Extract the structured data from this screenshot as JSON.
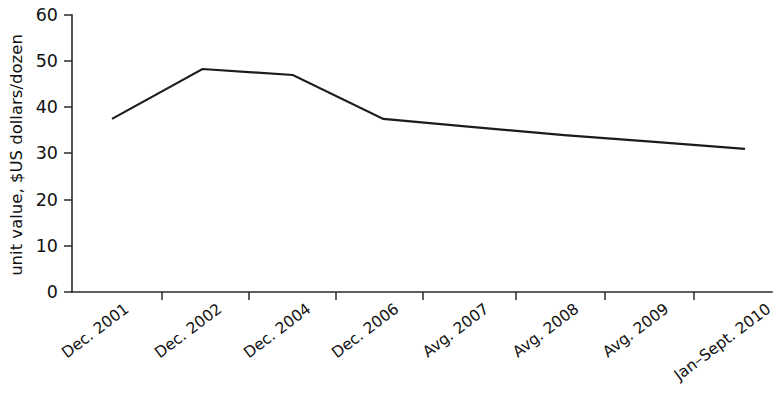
{
  "chart_data": {
    "type": "line",
    "title": "",
    "xlabel": "",
    "ylabel": "unit value, $US dollars/dozen",
    "categories": [
      "Dec. 2001",
      "Dec. 2002",
      "Dec. 2004",
      "Dec. 2006",
      "Avg. 2007",
      "Avg. 2008",
      "Avg. 2009",
      "Jan–Sept. 2010"
    ],
    "values": [
      37.5,
      48.3,
      47.0,
      37.5,
      35.7,
      34.0,
      32.5,
      31.0
    ],
    "ylim": [
      0,
      60
    ],
    "yticks": [
      0,
      10,
      20,
      30,
      40,
      50,
      60
    ],
    "ytick_labels": [
      "0",
      "10",
      "20",
      "30",
      "40",
      "50",
      "60"
    ],
    "grid": false,
    "legend": false,
    "series": [
      {
        "name": "unit value",
        "color": "#1c1c1c",
        "values": [
          37.5,
          48.3,
          47.0,
          37.5,
          35.7,
          34.0,
          32.5,
          31.0
        ]
      }
    ]
  },
  "axes": {
    "y_title": "unit value, $US dollars/dozen",
    "x_label_rotation_degrees": -37
  }
}
